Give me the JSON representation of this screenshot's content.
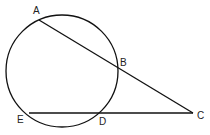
{
  "diagram": {
    "type": "geometry-secants",
    "circle": {
      "cx": 62,
      "cy": 71,
      "r": 56
    },
    "points": {
      "A": {
        "label": "A",
        "x": 39,
        "y": 20
      },
      "B": {
        "label": "B",
        "x": 117,
        "y": 67
      },
      "C": {
        "label": "C",
        "x": 193,
        "y": 113
      },
      "D": {
        "label": "D",
        "x": 98,
        "y": 113
      },
      "E": {
        "label": "E",
        "x": 29,
        "y": 113
      }
    },
    "segments": [
      [
        "A",
        "C"
      ],
      [
        "E",
        "C"
      ]
    ],
    "stroke_color": "#111111"
  }
}
